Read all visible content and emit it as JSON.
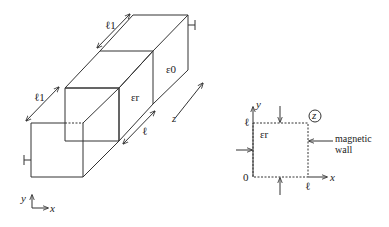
{
  "figure": {
    "left": {
      "outer_permittivity": "ε0",
      "inner_permittivity": "εr",
      "dim_top": "ℓ1",
      "dim_left": "ℓ1",
      "dim_inner": "ℓ",
      "axis_z": "z",
      "axis_y": "y",
      "axis_x": "x"
    },
    "right": {
      "axis_y": "y",
      "axis_x": "x",
      "origin": "0",
      "tick_y": "ℓ",
      "tick_x": "ℓ",
      "permittivity": "εr",
      "z_label": "z",
      "wall_label_1": "magnetic",
      "wall_label_2": "wall"
    }
  }
}
